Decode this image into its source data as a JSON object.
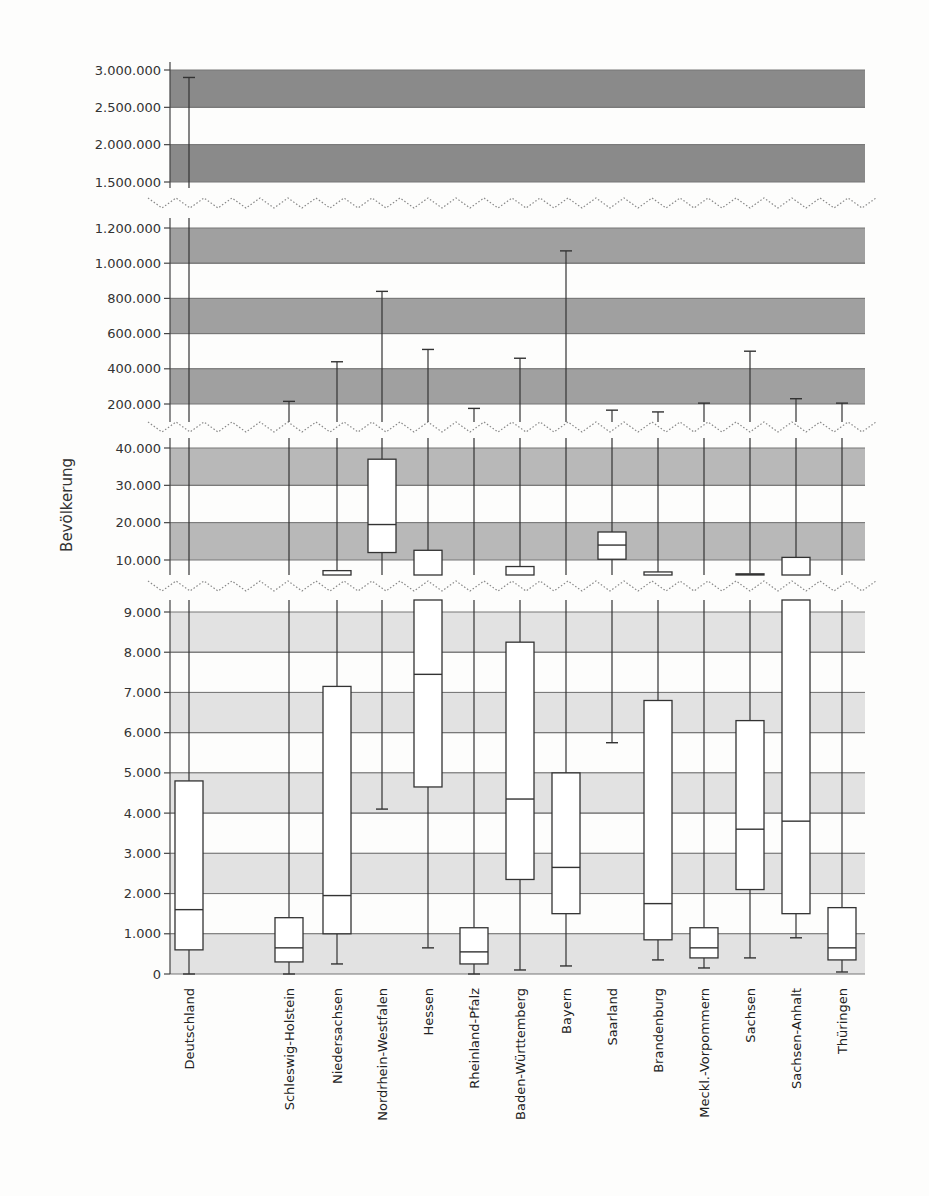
{
  "chart_data": {
    "type": "boxplot",
    "title": "",
    "ylabel": "Bevölkerung",
    "xlabel": "",
    "y_axis_broken": true,
    "panels": [
      {
        "name": "top",
        "ylim": [
          1400000,
          3100000
        ],
        "ticks": [
          3000000,
          2500000,
          2000000,
          1500000
        ],
        "tick_labels": [
          "3.000.000",
          "2.500.000",
          "2.000.000",
          "1.500.000"
        ],
        "band_color": "#8a8a8a"
      },
      {
        "name": "upper-mid",
        "ylim": [
          150000,
          1250000
        ],
        "ticks": [
          1200000,
          1000000,
          800000,
          600000,
          400000,
          200000
        ],
        "tick_labels": [
          "1.200.000",
          "1.000.000",
          "800.000",
          "600.000",
          "400.000",
          "200.000"
        ],
        "band_color": "#a0a0a0"
      },
      {
        "name": "lower-mid",
        "ylim": [
          9000,
          42000
        ],
        "ticks": [
          40000,
          30000,
          20000,
          10000
        ],
        "tick_labels": [
          "40.000",
          "30.000",
          "20.000",
          "10.000"
        ],
        "band_color": "#b8b8b8"
      },
      {
        "name": "bottom",
        "ylim": [
          0,
          9300
        ],
        "ticks": [
          9000,
          8000,
          7000,
          6000,
          5000,
          4000,
          3000,
          2000,
          1000,
          0
        ],
        "tick_labels": [
          "9.000",
          "8.000",
          "7.000",
          "6.000",
          "5.000",
          "4.000",
          "3.000",
          "2.000",
          "1.000",
          "0"
        ],
        "band_color": "#e2e2e2"
      }
    ],
    "categories": [
      "Deutschland",
      "Schleswig-Holstein",
      "Niedersachsen",
      "Nordrhein-Westfalen",
      "Hessen",
      "Rheinland-Pfalz",
      "Baden-Württemberg",
      "Bayern",
      "Saarland",
      "Brandenburg",
      "Meckl.-Vorpommern",
      "Sachsen",
      "Sachsen-Anhalt",
      "Thüringen"
    ],
    "series": [
      {
        "name": "Deutschland",
        "min": 0,
        "q1": 600,
        "median": 1600,
        "q3": 4800,
        "max": 2900000
      },
      {
        "name": "Schleswig-Holstein",
        "min": 0,
        "q1": 300,
        "median": 650,
        "q3": 1400,
        "max": 215000
      },
      {
        "name": "Niedersachsen",
        "min": 250,
        "q1": 1000,
        "median": 1950,
        "q3": 7150,
        "max": 440000
      },
      {
        "name": "Nordrhein-Westfalen",
        "min": 4100,
        "q1": 12000,
        "median": 19500,
        "q3": 37000,
        "max": 840000
      },
      {
        "name": "Hessen",
        "min": 650,
        "q1": 4650,
        "median": 7450,
        "q3": 12600,
        "max": 510000
      },
      {
        "name": "Rheinland-Pfalz",
        "min": 0,
        "q1": 250,
        "median": 550,
        "q3": 1150,
        "max": 175000
      },
      {
        "name": "Baden-Württemberg",
        "min": 100,
        "q1": 2350,
        "median": 4350,
        "q3": 8250,
        "max": 460000
      },
      {
        "name": "Bayern",
        "min": 200,
        "q1": 1500,
        "median": 2650,
        "q3": 5000,
        "max": 1070000
      },
      {
        "name": "Saarland",
        "min": 5750,
        "q1": 10200,
        "median": 14000,
        "q3": 17500,
        "max": 165000
      },
      {
        "name": "Brandenburg",
        "min": 350,
        "q1": 850,
        "median": 1750,
        "q3": 6800,
        "max": 155000
      },
      {
        "name": "Meckl.-Vorpommern",
        "min": 150,
        "q1": 400,
        "median": 650,
        "q3": 1150,
        "max": 205000
      },
      {
        "name": "Sachsen",
        "min": 400,
        "q1": 2100,
        "median": 3600,
        "q3": 6300,
        "max": 500000
      },
      {
        "name": "Sachsen-Anhalt",
        "min": 900,
        "q1": 1500,
        "median": 3800,
        "q3": 10700,
        "max": 230000
      },
      {
        "name": "Thüringen",
        "min": 50,
        "q1": 350,
        "median": 650,
        "q3": 1650,
        "max": 205000
      }
    ],
    "grid": "alternating horizontal bands",
    "legend": null
  }
}
